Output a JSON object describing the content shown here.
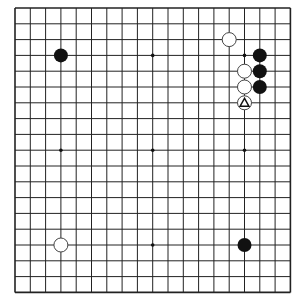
{
  "board": {
    "size": 19,
    "origin_x": 15,
    "origin_y": 8,
    "spacing_x": 15.3,
    "spacing_y": 15.8,
    "line_color": "#222222",
    "background": "#ffffff",
    "star_points": [
      [
        3,
        3
      ],
      [
        9,
        3
      ],
      [
        15,
        3
      ],
      [
        3,
        9
      ],
      [
        9,
        9
      ],
      [
        15,
        9
      ],
      [
        3,
        15
      ],
      [
        9,
        15
      ],
      [
        15,
        15
      ]
    ]
  },
  "stones": [
    {
      "color": "black",
      "col": 3,
      "row": 3
    },
    {
      "color": "white",
      "col": 14,
      "row": 2
    },
    {
      "color": "black",
      "col": 16,
      "row": 3
    },
    {
      "color": "black",
      "col": 16,
      "row": 4
    },
    {
      "color": "black",
      "col": 16,
      "row": 5
    },
    {
      "color": "white",
      "col": 15,
      "row": 4
    },
    {
      "color": "white",
      "col": 15,
      "row": 5
    },
    {
      "color": "white",
      "col": 15,
      "row": 6,
      "mark": "triangle"
    },
    {
      "color": "white",
      "col": 3,
      "row": 15
    },
    {
      "color": "black",
      "col": 15,
      "row": 15
    }
  ]
}
